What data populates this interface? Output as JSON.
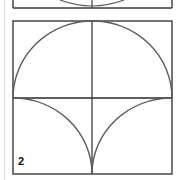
{
  "figure": {
    "panels": [
      {
        "label": "1",
        "visible": "partial (bottom edge only)"
      },
      {
        "label": "2",
        "description": "Semicircle above horizontal midline, two concave quarter-arcs below meeting at a bottom cusp, vertical center line"
      }
    ],
    "colors": {
      "stroke_box": "#3a3a3a",
      "stroke_arc": "#5a5a5a",
      "page_rule": "#e2e2e2",
      "background": "#ffffff"
    }
  }
}
